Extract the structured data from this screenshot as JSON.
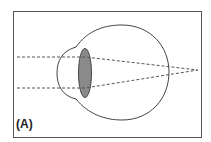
{
  "diagram": {
    "panel_label": "(A)",
    "elements": [
      "frame",
      "eyeball",
      "cornea",
      "lens",
      "light-ray-upper",
      "light-ray-lower",
      "focal-point"
    ],
    "colors": {
      "stroke": "#444444",
      "lens_fill": "#8a8a8a",
      "frame": "#555555",
      "background": "#ffffff"
    }
  }
}
